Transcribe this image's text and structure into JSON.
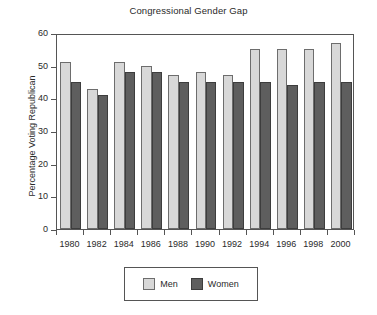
{
  "chart_data": {
    "type": "bar",
    "title": "Congressional Gender Gap",
    "xlabel": "",
    "ylabel": "Percentage Voting Republican",
    "categories": [
      "1980",
      "1982",
      "1984",
      "1986",
      "1988",
      "1990",
      "1992",
      "1994",
      "1996",
      "1998",
      "2000"
    ],
    "series": [
      {
        "name": "Men",
        "color": "#d8d8d8",
        "values": [
          51,
          43,
          51,
          50,
          47,
          48,
          47,
          55,
          55,
          55,
          57
        ]
      },
      {
        "name": "Women",
        "color": "#5e5e5e",
        "values": [
          45,
          41,
          48,
          48,
          45,
          45,
          45,
          45,
          44,
          45,
          45
        ]
      }
    ],
    "ylim": [
      0,
      60
    ],
    "yticks": [
      0,
      10,
      20,
      30,
      40,
      50,
      60
    ],
    "ytick_labels": [
      "0",
      "10",
      "20",
      "30",
      "40",
      "50",
      "60"
    ],
    "grid": false,
    "legend_position": "below-center",
    "legend_entries": [
      "Men",
      "Women"
    ]
  }
}
